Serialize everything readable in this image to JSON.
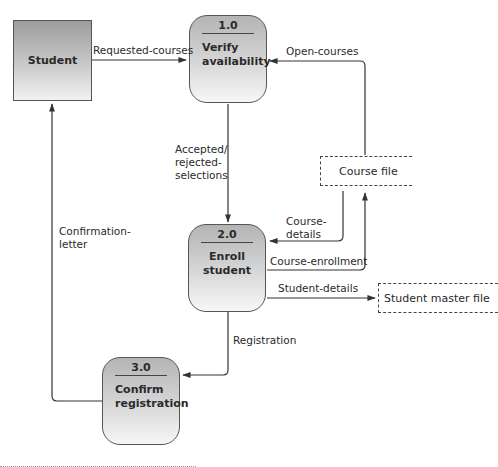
{
  "diagram": {
    "type": "data-flow-diagram",
    "external_entities": [
      {
        "id": "student",
        "label": "Student"
      }
    ],
    "processes": [
      {
        "id": "1.0",
        "number": "1.0",
        "name_line1": "Verify",
        "name_line2": "availability"
      },
      {
        "id": "2.0",
        "number": "2.0",
        "name_line1": "Enroll",
        "name_line2": "student"
      },
      {
        "id": "3.0",
        "number": "3.0",
        "name_line1": "Confirm",
        "name_line2": "registration"
      }
    ],
    "data_stores": [
      {
        "id": "course-file",
        "label": "Course file"
      },
      {
        "id": "student-master-file",
        "label": "Student master file"
      }
    ],
    "flows": [
      {
        "id": "requested-courses",
        "from": "Student",
        "to": "1.0",
        "line1": "Requested-courses"
      },
      {
        "id": "open-courses",
        "from": "Course file",
        "to": "1.0",
        "line1": "Open-courses"
      },
      {
        "id": "accepted-rejected",
        "from": "1.0",
        "to": "2.0",
        "line1": "Accepted/",
        "line2": "rejected-",
        "line3": "selections"
      },
      {
        "id": "course-details",
        "from": "Course file",
        "to": "2.0",
        "line1": "Course-",
        "line2": "details"
      },
      {
        "id": "course-enrollment",
        "from": "2.0",
        "to": "Course file",
        "line1": "Course-enrollment"
      },
      {
        "id": "student-details",
        "from": "2.0",
        "to": "Student master file",
        "line1": "Student-details"
      },
      {
        "id": "registration",
        "from": "2.0",
        "to": "3.0",
        "line1": "Registration"
      },
      {
        "id": "confirmation-letter",
        "from": "3.0",
        "to": "Student",
        "line1": "Confirmation-",
        "line2": "letter"
      }
    ]
  }
}
